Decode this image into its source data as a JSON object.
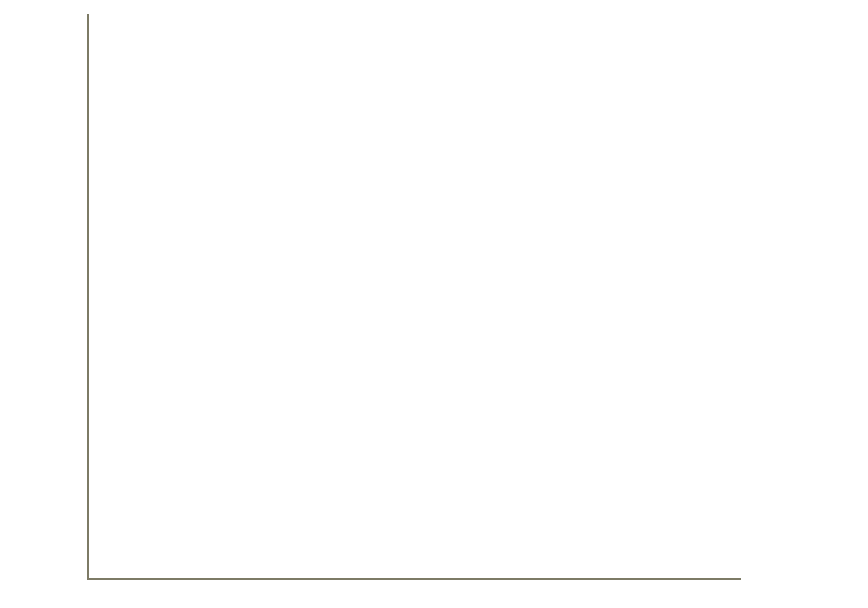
{
  "chart_data": {
    "type": "area",
    "stacked": true,
    "title": "",
    "subtitle": "",
    "xlabel": "",
    "ylabel": "Millions of constant 2000 dollars",
    "categories": [
      "1990",
      "1991",
      "1992",
      "1993",
      "1994",
      "1995",
      "1996",
      "1997",
      "1998",
      "1999",
      "2000",
      "2001",
      "2002",
      "2003",
      "2004",
      "2005",
      "2006",
      "2007",
      "2008"
    ],
    "x": [
      1990,
      1991,
      1992,
      1993,
      1994,
      1995,
      1996,
      1997,
      1998,
      1999,
      2000,
      2001,
      2002,
      2003,
      2004,
      2005,
      2006,
      2007,
      2008
    ],
    "series": [
      {
        "name": "University",
        "color": "#b5491f",
        "values": [
          2450,
          2570,
          2620,
          2660,
          2730,
          2800,
          2980,
          3300,
          3560,
          3830,
          4130,
          4520,
          4800,
          4900,
          5000,
          5200,
          5500,
          5900,
          6300
        ]
      },
      {
        "name": "Federal",
        "color": "#7381b4",
        "values": [
          5950,
          6230,
          6580,
          6830,
          7130,
          7350,
          7780,
          8000,
          8300,
          8670,
          9070,
          10480,
          11700,
          13100,
          14150,
          14580,
          14100,
          13500,
          13130
        ]
      }
    ],
    "totals": [
      8400,
      8800,
      9200,
      9490,
      9860,
      10150,
      10760,
      11300,
      11860,
      12500,
      13200,
      15000,
      16500,
      18000,
      19150,
      19780,
      19600,
      19400,
      19430
    ],
    "ylim": [
      0,
      25000
    ],
    "yticks": [
      0,
      5000,
      10000,
      15000,
      20000,
      25000
    ],
    "ytick_labels": [
      "0",
      "5,000",
      "10,000",
      "15,000",
      "20,000",
      "25,000"
    ],
    "xlim": [
      1990,
      2008
    ],
    "grid": true,
    "grid_color": "#8d8a6e",
    "legend_position": "right",
    "legend": [
      {
        "label": "Federal",
        "color": "#7381b4",
        "swatch_name": "legend-swatch-federal"
      },
      {
        "label": "University",
        "color": "#b5491f",
        "swatch_name": "legend-swatch-university"
      }
    ]
  },
  "axes": {
    "y_axis_title": "Millions of constant 2000 dollars"
  }
}
